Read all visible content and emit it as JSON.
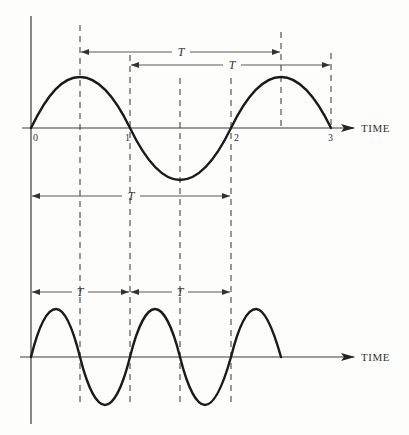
{
  "top_graph": {
    "axis_label": "TIME",
    "ticks": [
      "0",
      "1",
      "2",
      "3"
    ],
    "period_labels": [
      "T",
      "T",
      "T"
    ]
  },
  "bottom_graph": {
    "axis_label": "TIME",
    "period_labels": [
      "T",
      "T"
    ]
  },
  "colors": {
    "background": "#fdfdfc",
    "ink": "#1a1a1a"
  }
}
